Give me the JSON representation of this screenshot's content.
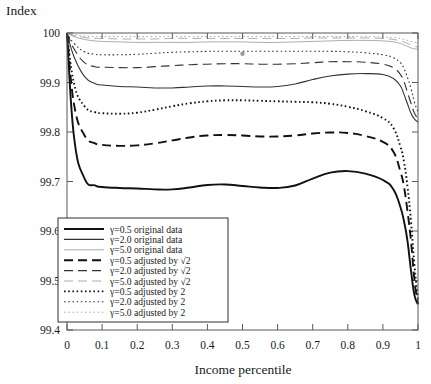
{
  "figure": {
    "background": "#ffffff",
    "frame_color": "#555a5e"
  },
  "axes": {
    "y_title": "Index",
    "x_title": "Income percentile",
    "y_ticks": [
      "99.4",
      "99.5",
      "99.6",
      "99.7",
      "99.8",
      "99.9",
      "100"
    ],
    "x_ticks": [
      "0",
      "0.1",
      "0.2",
      "0.3",
      "0.4",
      "0.5",
      "0.6",
      "0.7",
      "0.8",
      "0.9",
      "1"
    ]
  },
  "legend": {
    "items": [
      {
        "label": "γ=0.5 original data",
        "style": "solid",
        "width": 1.9,
        "color": "#111111",
        "dash": "none"
      },
      {
        "label": "γ=2.0 original data",
        "style": "solid",
        "width": 1.1,
        "color": "#333333",
        "dash": "none"
      },
      {
        "label": "γ=5.0 original data",
        "style": "solid",
        "width": 0.7,
        "color": "#888888",
        "dash": "none"
      },
      {
        "label": "γ=0.5 adjusted by √2",
        "style": "dashed",
        "width": 1.9,
        "color": "#111111",
        "dash": "9,5"
      },
      {
        "label": "γ=2.0 adjusted by √2",
        "style": "dashed",
        "width": 1.1,
        "color": "#333333",
        "dash": "9,5"
      },
      {
        "label": "γ=5.0 adjusted by √2",
        "style": "dashed",
        "width": 0.7,
        "color": "#888888",
        "dash": "9,5"
      },
      {
        "label": "γ=0.5 adjusted by 2",
        "style": "dotted",
        "width": 1.9,
        "color": "#111111",
        "dash": "1.6,2.6"
      },
      {
        "label": "γ=2.0 adjusted by 2",
        "style": "dotted",
        "width": 1.1,
        "color": "#333333",
        "dash": "1.6,2.6"
      },
      {
        "label": "γ=5.0 adjusted by 2",
        "style": "dotted",
        "width": 0.7,
        "color": "#888888",
        "dash": "1.6,2.6"
      }
    ]
  },
  "chart_data": {
    "type": "line",
    "title": "",
    "xlabel": "Income percentile",
    "ylabel": "Index",
    "xlim": [
      0,
      1
    ],
    "ylim": [
      99.4,
      100
    ],
    "grid": false,
    "legend_position": "lower-left-inside",
    "x": [
      0,
      0.02,
      0.05,
      0.08,
      0.1,
      0.15,
      0.2,
      0.25,
      0.3,
      0.35,
      0.4,
      0.45,
      0.5,
      0.55,
      0.6,
      0.65,
      0.7,
      0.75,
      0.8,
      0.85,
      0.9,
      0.93,
      0.95,
      0.96,
      0.97,
      0.98,
      0.99,
      1
    ],
    "series": [
      {
        "name": "γ=0.5 original data",
        "values": [
          100.0,
          99.79,
          99.706,
          99.692,
          99.689,
          99.687,
          99.686,
          99.684,
          99.684,
          99.688,
          99.693,
          99.694,
          99.691,
          99.688,
          99.687,
          99.692,
          99.706,
          99.718,
          99.721,
          99.716,
          99.703,
          99.684,
          99.648,
          99.62,
          99.58,
          99.52,
          99.47,
          99.452
        ]
      },
      {
        "name": "γ=2.0 original data",
        "values": [
          100.0,
          99.952,
          99.912,
          99.898,
          99.895,
          99.892,
          99.891,
          99.889,
          99.889,
          99.891,
          99.893,
          99.893,
          99.892,
          99.891,
          99.892,
          99.897,
          99.906,
          99.913,
          99.917,
          99.918,
          99.916,
          99.908,
          99.893,
          99.876,
          99.857,
          99.838,
          99.826,
          99.82
        ]
      },
      {
        "name": "γ=5.0 original data",
        "values": [
          100.0,
          99.993,
          99.987,
          99.984,
          99.983,
          99.982,
          99.981,
          99.981,
          99.981,
          99.981,
          99.982,
          99.982,
          99.982,
          99.981,
          99.981,
          99.982,
          99.983,
          99.984,
          99.985,
          99.985,
          99.984,
          99.982,
          99.979,
          99.976,
          99.973,
          99.97,
          99.968,
          99.967
        ]
      },
      {
        "name": "γ=0.5 adjusted by √2",
        "values": [
          100.0,
          99.856,
          99.793,
          99.777,
          99.774,
          99.772,
          99.773,
          99.777,
          99.783,
          99.789,
          99.793,
          99.794,
          99.793,
          99.791,
          99.791,
          99.793,
          99.797,
          99.799,
          99.798,
          99.792,
          99.78,
          99.76,
          99.72,
          99.69,
          99.64,
          99.58,
          99.5,
          99.452
        ]
      },
      {
        "name": "γ=2.0 adjusted by √2",
        "values": [
          100.0,
          99.968,
          99.94,
          99.932,
          99.931,
          99.93,
          99.93,
          99.932,
          99.934,
          99.936,
          99.937,
          99.938,
          99.938,
          99.937,
          99.937,
          99.938,
          99.94,
          99.942,
          99.942,
          99.941,
          99.937,
          99.93,
          99.916,
          99.902,
          99.88,
          99.858,
          99.838,
          99.828
        ]
      },
      {
        "name": "γ=5.0 adjusted by √2",
        "values": [
          100.0,
          99.995,
          99.991,
          99.989,
          99.989,
          99.988,
          99.988,
          99.988,
          99.989,
          99.989,
          99.989,
          99.989,
          99.989,
          99.989,
          99.989,
          99.989,
          99.99,
          99.99,
          99.99,
          99.99,
          99.989,
          99.987,
          99.984,
          99.982,
          99.979,
          99.976,
          99.973,
          99.972
        ]
      },
      {
        "name": "γ=0.5 adjusted by 2",
        "values": [
          100.0,
          99.898,
          99.852,
          99.84,
          99.838,
          99.837,
          99.839,
          99.845,
          99.852,
          99.858,
          99.862,
          99.864,
          99.864,
          99.863,
          99.862,
          99.861,
          99.86,
          99.857,
          99.851,
          99.842,
          99.828,
          99.808,
          99.77,
          99.74,
          99.69,
          99.62,
          99.53,
          99.46
        ]
      },
      {
        "name": "γ=2.0 adjusted by 2",
        "values": [
          100.0,
          99.979,
          99.962,
          99.957,
          99.956,
          99.956,
          99.957,
          99.959,
          99.961,
          99.962,
          99.963,
          99.963,
          99.963,
          99.963,
          99.963,
          99.963,
          99.963,
          99.963,
          99.962,
          99.96,
          99.956,
          99.95,
          99.94,
          99.928,
          99.91,
          99.888,
          99.86,
          99.84
        ]
      },
      {
        "name": "γ=5.0 adjusted by 2",
        "values": [
          100.0,
          99.997,
          99.994,
          99.993,
          99.993,
          99.993,
          99.993,
          99.993,
          99.993,
          99.993,
          99.993,
          99.993,
          99.993,
          99.993,
          99.993,
          99.993,
          99.993,
          99.993,
          99.993,
          99.993,
          99.992,
          99.991,
          99.989,
          99.987,
          99.985,
          99.983,
          99.981,
          99.98
        ]
      }
    ],
    "annotations": [
      {
        "name": "stray-marker-dot",
        "x": 0.5,
        "y": 99.958
      }
    ]
  }
}
